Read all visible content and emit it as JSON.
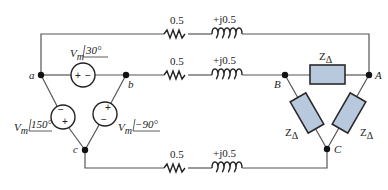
{
  "diagram": {
    "type": "three-phase circuit",
    "colors": {
      "wire": "#555555",
      "impedance_fill": "#b8c8dd",
      "node": "#111111"
    },
    "nodes": {
      "a": "a",
      "b": "b",
      "c": "c",
      "A": "A",
      "B": "B",
      "C": "C"
    },
    "sources": [
      {
        "id": "ab",
        "magnitude": "V",
        "sub": "m",
        "angle": "30°",
        "polarity_left": "+",
        "polarity_right": "−"
      },
      {
        "id": "ca",
        "magnitude": "V",
        "sub": "m",
        "angle": "150°",
        "polarity_top": "−",
        "polarity_bottom": "+"
      },
      {
        "id": "bc",
        "magnitude": "V",
        "sub": "m",
        "angle": "−90°",
        "polarity_top": "+",
        "polarity_bottom": "−"
      }
    ],
    "lines": [
      {
        "resistance": "0.5",
        "reactance": "+j0.5"
      },
      {
        "resistance": "0.5",
        "reactance": "+j0.5"
      },
      {
        "resistance": "0.5",
        "reactance": "+j0.5"
      }
    ],
    "load": {
      "impedances": [
        {
          "label": "Z",
          "sub": "Δ"
        },
        {
          "label": "Z",
          "sub": "Δ"
        },
        {
          "label": "Z",
          "sub": "Δ"
        }
      ]
    }
  }
}
